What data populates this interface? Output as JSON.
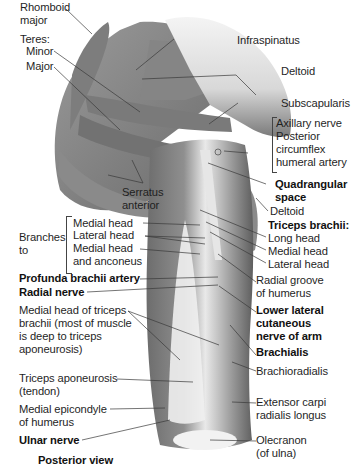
{
  "figure": {
    "caption": "Posterior view",
    "colors": {
      "muscle_dark": "#6e6e6e",
      "muscle_mid": "#8c8c8c",
      "muscle_light": "#a9a9a9",
      "tendon": "#eeeeee",
      "leader_line": "#3a3a3a"
    }
  },
  "labels_left": {
    "rhomboid_major": [
      "Rhomboid",
      "major"
    ],
    "teres": "Teres:",
    "teres_minor": "Minor",
    "teres_major": "Major",
    "serratus_anterior": [
      "Serratus",
      "anterior"
    ],
    "branches_to": [
      "Branches",
      "to"
    ],
    "branch_medial_head": "Medial head",
    "branch_lateral_head": "Lateral head",
    "branch_medial_anconeus": [
      "Medial head",
      "and anconeus"
    ],
    "profunda_brachii_artery": "Profunda brachii artery",
    "radial_nerve": "Radial nerve",
    "medial_head_triceps": [
      "Medial head of triceps",
      "brachii (most of muscle",
      "is deep to triceps",
      "aponeurosis)"
    ],
    "triceps_aponeurosis": [
      "Triceps aponeurosis",
      "(tendon)"
    ],
    "medial_epicondyle": [
      "Medial epicondyle",
      "of humerus"
    ],
    "ulnar_nerve": "Ulnar nerve"
  },
  "labels_right": {
    "infraspinatus": "Infraspinatus",
    "deltoid_top": "Deltoid",
    "subscapularis": "Subscapularis",
    "axillary_group": [
      "Axillary nerve",
      "Posterior",
      "circumflex",
      "humeral artery"
    ],
    "quadrangular_space": [
      "Quadrangular",
      "space"
    ],
    "deltoid_lower": "Deltoid",
    "triceps_brachii": "Triceps brachii:",
    "long_head": "Long head",
    "medial_head": "Medial head",
    "lateral_head": "Lateral head",
    "radial_groove": [
      "Radial groove",
      "of humerus"
    ],
    "lower_lateral_cutaneous": [
      "Lower lateral",
      "cutaneous",
      "nerve of arm"
    ],
    "brachialis": "Brachialis",
    "brachioradialis": "Brachioradialis",
    "ecrl": [
      "Extensor carpi",
      "radialis longus"
    ],
    "olecranon": [
      "Olecranon",
      "(of ulna)"
    ]
  }
}
